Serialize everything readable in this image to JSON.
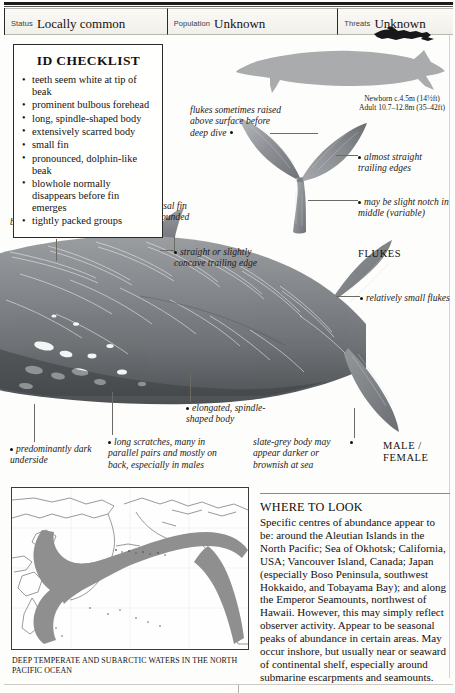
{
  "header": {
    "fields": [
      {
        "key": "Status",
        "value": "Locally common"
      },
      {
        "key": "Population",
        "value": "Unknown"
      },
      {
        "key": "Threats",
        "value": "Unknown"
      }
    ]
  },
  "checklist": {
    "title": "ID CHECKLIST",
    "items": [
      "teeth seem white at tip of beak",
      "prominent bulbous forehead",
      "long, spindle-shaped body",
      "extensively scarred body",
      "small fin",
      "pronounced, dolphin-like beak",
      "blowhole normally disappears before fin emerges",
      "tightly packed groups"
    ]
  },
  "size": {
    "newborn": "Newborn c.4.5m (14½ft)",
    "adult": "Adult 10.7–12.8m (35–42ft)"
  },
  "annotations": {
    "flukes_raised": "flukes sometimes raised above surface before deep dive",
    "trailing_edges": "almost straight trailing edges",
    "notch": "may be slight notch in middle (variable)",
    "small_flukes": "relatively small flukes",
    "broad_back": "broad, flat back",
    "dorsal_fin": "small, low dorsal fin with slightly rounded tip",
    "concave_edge": "straight or slightly concave trailing edge",
    "dark_underside": "predominantly dark underside",
    "scratches": "long scratches, many in parallel pairs and mostly on back, especially in males",
    "spindle_body": "elongated, spindle-shaped body",
    "slate_grey": "slate-grey body may appear darker or brownish at sea"
  },
  "labels": {
    "flukes": "FLUKES",
    "male_female": "MALE / FEMALE"
  },
  "map": {
    "caption": "DEEP TEMPERATE AND SUBARCTIC WATERS IN THE NORTH PACIFIC OCEAN",
    "range_color": "#8f8f8f",
    "ocean_color": "#fefefe",
    "land_outline_color": "#6f6f6f"
  },
  "where_to_look": {
    "title": "WHERE TO LOOK",
    "body": "Specific centres of abundance appear to be: around the Aleutian Islands in the North Pacific; Sea of Okhotsk; California, USA; Vancouver Island, Canada; Japan (especially Boso Peninsula, southwest Hokkaido, and Tobayama Bay); and along the Emperor Seamounts, northwest of Hawaii. However, this may simply reflect observer activity. Appear to be seasonal peaks of abundance in certain areas. May occur inshore, but usually near or seaward of continental shelf, especially around submarine escarpments and seamounts."
  },
  "illustration": {
    "body_color": "#8d9094",
    "silhouette_color": "#a9abad",
    "diver_color": "#16181a"
  }
}
